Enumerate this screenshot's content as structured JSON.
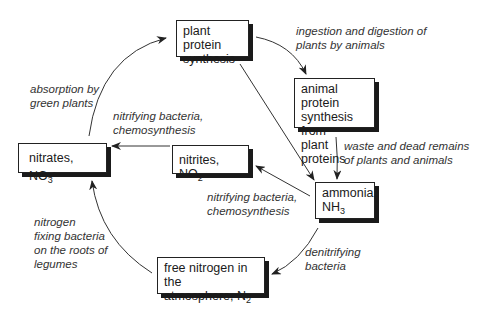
{
  "diagram": {
    "nodes": {
      "plant_protein": {
        "text": "plant protein synthesis",
        "line1": "plant protein",
        "line2": "synthesis"
      },
      "animal_protein": {
        "text": "animal protein synthesis from plant proteins",
        "line1": "animal protein",
        "line2": "synthesis from",
        "line3": "plant proteins"
      },
      "ammonia": {
        "line1": "ammonia,",
        "line2_main": "NH",
        "line2_sub": "3"
      },
      "nitrites": {
        "main": "nitrites, NO",
        "sub": "2"
      },
      "nitrates": {
        "main": "nitrates, NO",
        "sub": "3",
        "sup": "-"
      },
      "free_nitrogen": {
        "line1": "free nitrogen in the",
        "line2_main": "atmosphere, N",
        "line2_sub": "2"
      }
    },
    "edges": [
      {
        "from": "plant_protein",
        "to": "animal_protein",
        "line1": "ingestion and digestion of",
        "line2": "plants by animals"
      },
      {
        "from": "animal_protein",
        "to": "ammonia",
        "line1": "waste and dead remains",
        "line2": "of plants and animals"
      },
      {
        "from": "plant_protein",
        "to": "ammonia",
        "line1": "",
        "line2": ""
      },
      {
        "from": "ammonia",
        "to": "nitrites",
        "line1": "nitrifying bacteria,",
        "line2": "chemosynthesis"
      },
      {
        "from": "nitrites",
        "to": "nitrates",
        "line1": "nitrifying bacteria,",
        "line2": "chemosynthesis"
      },
      {
        "from": "nitrates",
        "to": "plant_protein",
        "line1": "absorption by",
        "line2": "green plants"
      },
      {
        "from": "ammonia",
        "to": "free_nitrogen",
        "line1": "denitrifying",
        "line2": "bacteria"
      },
      {
        "from": "free_nitrogen",
        "to": "nitrates",
        "line1": "nitrogen",
        "line2": "fixing bacteria",
        "line3": "on the roots of",
        "line4": "legumes"
      }
    ]
  }
}
